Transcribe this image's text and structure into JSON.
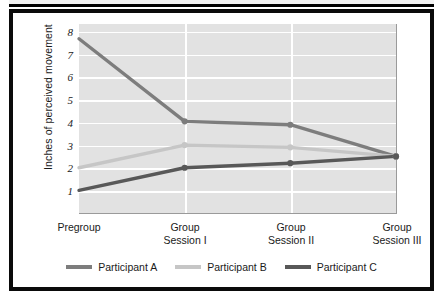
{
  "chart_data": {
    "type": "line",
    "title": "",
    "subtitle": "",
    "xlabel": "",
    "ylabel": "Inches of perceived movement",
    "categories": [
      "Pregroup",
      "Group Session I",
      "Group Session II",
      "Group Session III"
    ],
    "category_lines": [
      [
        "Pregroup"
      ],
      [
        "Group",
        "Session I"
      ],
      [
        "Group",
        "Session II"
      ],
      [
        "Group",
        "Session III"
      ]
    ],
    "yticks": [
      1,
      2,
      3,
      4,
      5,
      6,
      7,
      8
    ],
    "ylim": [
      0,
      8.35
    ],
    "grid": "horizontal-and-vertical",
    "legend_position": "bottom-center",
    "series": [
      {
        "name": "Participant A",
        "color": "#7d7d7d",
        "values": [
          7.7,
          4.05,
          3.9,
          2.5
        ]
      },
      {
        "name": "Participant B",
        "color": "#c6c6c6",
        "values": [
          2.0,
          3.0,
          2.9,
          2.5
        ]
      },
      {
        "name": "Participant C",
        "color": "#585858",
        "values": [
          1.0,
          2.0,
          2.2,
          2.5
        ]
      }
    ]
  },
  "legend": {
    "items": [
      {
        "label": "Participant A",
        "color": "#7d7d7d"
      },
      {
        "label": "Participant B",
        "color": "#c6c6c6"
      },
      {
        "label": "Participant C",
        "color": "#585858"
      }
    ]
  },
  "axis": {
    "y_title": "Inches of perceived movement",
    "y_tick_labels": [
      "8",
      "7",
      "6",
      "5",
      "4",
      "3",
      "2",
      "1"
    ],
    "x_tick_labels": [
      "Pregroup",
      "Group\nSession I",
      "Group\nSession II",
      "Group\nSession III"
    ]
  },
  "colors": {
    "plot_background": "#e2e2e2",
    "gridline": "#ffffff",
    "frame": "#0a0a0a",
    "axis": "#8f8f8f",
    "text": "#1a1a1a"
  }
}
